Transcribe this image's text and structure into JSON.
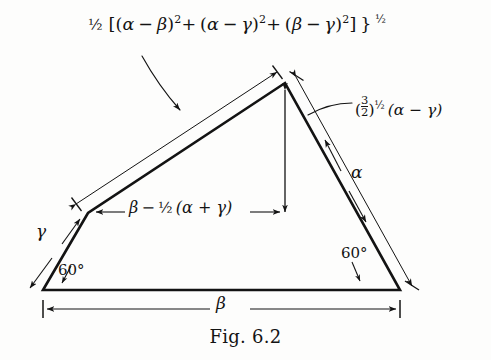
{
  "figure": {
    "caption": "Fig. 6.2",
    "background_color": "#fdfdfc",
    "ink_color": "#131313"
  },
  "labels": {
    "top_formula": {
      "half_coefficient": "½",
      "open_bracket": "[",
      "term1_open": "(",
      "term1_a": "α",
      "term1_minus": "−",
      "term1_b": "β",
      "term1_close": ")",
      "term1_exp": "2",
      "plus1": "+",
      "term2_open": "(",
      "term2_a": "α",
      "term2_minus": "−",
      "term2_b": "γ",
      "term2_close": ")",
      "term2_exp": "2",
      "plus2": "+",
      "term3_open": "(",
      "term3_a": "β",
      "term3_minus": "−",
      "term3_b": "γ",
      "term3_close": ")",
      "term3_exp": "2",
      "close_bracket": "]",
      "close_brace": "}",
      "outer_exp": "½",
      "plain_text": "½ [(α − β)² + (α − γ)² + (β − γ)²] }^½"
    },
    "right_edge_label": {
      "open_paren": "(",
      "fraction_num": "3",
      "fraction_den": "2",
      "close_paren": ")",
      "exponent": "½",
      "expression": "(α − γ)",
      "plain_text": "(3/2)^½ (α − γ)"
    },
    "middle_span_label": {
      "plain_text": "β − ½ (α + γ)",
      "beta": "β",
      "minus": "−",
      "half": "½",
      "group": "(α + γ)"
    },
    "gamma_edge": "γ",
    "alpha_edge": "α",
    "beta_base": "β",
    "angle_left": "60°",
    "angle_right": "60°"
  },
  "geometry": {
    "vertices": {
      "bottom_left": [
        43,
        290
      ],
      "left_mid": [
        88,
        213
      ],
      "apex": [
        285,
        83
      ],
      "bottom_right": [
        400,
        290
      ]
    }
  }
}
